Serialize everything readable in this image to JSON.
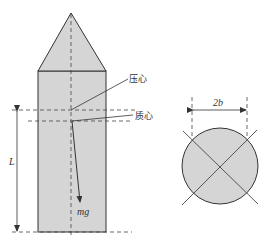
{
  "figure": {
    "side_view": {
      "label_pressure_center": "压心",
      "label_mass_center": "质心",
      "label_weight": "mg",
      "label_length": "L"
    },
    "cross_section": {
      "label_diameter": "2b"
    }
  },
  "colors": {
    "fill": "#d5d5d5",
    "stroke": "#333333",
    "dash": "#444444"
  }
}
